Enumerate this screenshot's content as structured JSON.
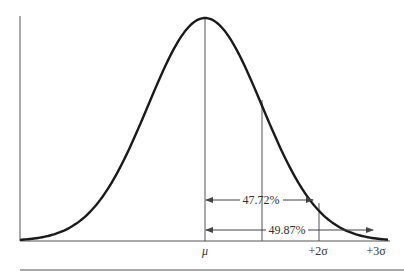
{
  "diagram": {
    "type": "normal-distribution",
    "title": "",
    "colors": {
      "curve": "#1a1a1a",
      "lines": "#555555",
      "text": "#333333",
      "background": "#ffffff"
    },
    "axis_labels": [
      {
        "id": "mu",
        "text": "μ"
      },
      {
        "id": "plus2sigma",
        "text": "+2σ"
      },
      {
        "id": "plus3sigma",
        "text": "+3σ"
      }
    ],
    "annotations": [
      {
        "id": "within-2sigma",
        "text": "47.72%",
        "from": "μ",
        "to": "+2σ"
      },
      {
        "id": "within-3sigma",
        "text": "49.87%",
        "from": "μ",
        "to": "+3σ"
      }
    ],
    "reference_lines": [
      "μ",
      "+1σ",
      "+2σ"
    ]
  }
}
